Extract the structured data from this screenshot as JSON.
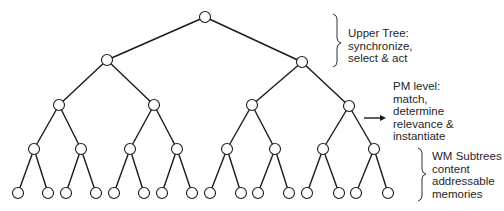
{
  "diagram": {
    "type": "binary-tree",
    "levels": 5,
    "nodes": {
      "root": {
        "x": 205,
        "y": 17
      },
      "level1": [
        {
          "x": 107,
          "y": 60
        },
        {
          "x": 302,
          "y": 62
        }
      ],
      "level2": [
        {
          "x": 59,
          "y": 105
        },
        {
          "x": 154,
          "y": 105
        },
        {
          "x": 252,
          "y": 105
        },
        {
          "x": 349,
          "y": 106
        }
      ],
      "level3": [
        {
          "x": 34,
          "y": 149
        },
        {
          "x": 81,
          "y": 149
        },
        {
          "x": 130,
          "y": 149
        },
        {
          "x": 177,
          "y": 149
        },
        {
          "x": 227,
          "y": 149
        },
        {
          "x": 275,
          "y": 149
        },
        {
          "x": 323,
          "y": 149
        },
        {
          "x": 374,
          "y": 149
        }
      ],
      "level4": [
        {
          "x": 18,
          "y": 193
        },
        {
          "x": 48,
          "y": 193
        },
        {
          "x": 66,
          "y": 193
        },
        {
          "x": 96,
          "y": 193
        },
        {
          "x": 114,
          "y": 193
        },
        {
          "x": 144,
          "y": 193
        },
        {
          "x": 162,
          "y": 193
        },
        {
          "x": 192,
          "y": 193
        },
        {
          "x": 210,
          "y": 193
        },
        {
          "x": 241,
          "y": 193
        },
        {
          "x": 258,
          "y": 193
        },
        {
          "x": 289,
          "y": 193
        },
        {
          "x": 307,
          "y": 193
        },
        {
          "x": 339,
          "y": 193
        },
        {
          "x": 356,
          "y": 193
        },
        {
          "x": 388,
          "y": 193
        }
      ]
    },
    "node_radius": 5.5
  },
  "annotations": {
    "upper_tree": {
      "lines": [
        "Upper Tree:",
        "synchronize,",
        "select & act"
      ]
    },
    "pm_level": {
      "lines": [
        "PM level:",
        "match,",
        "determine",
        "relevance &",
        "instantiate"
      ]
    },
    "wm_subtrees": {
      "lines": [
        "WM Subtrees",
        "content",
        "addressable",
        "memories"
      ]
    }
  }
}
